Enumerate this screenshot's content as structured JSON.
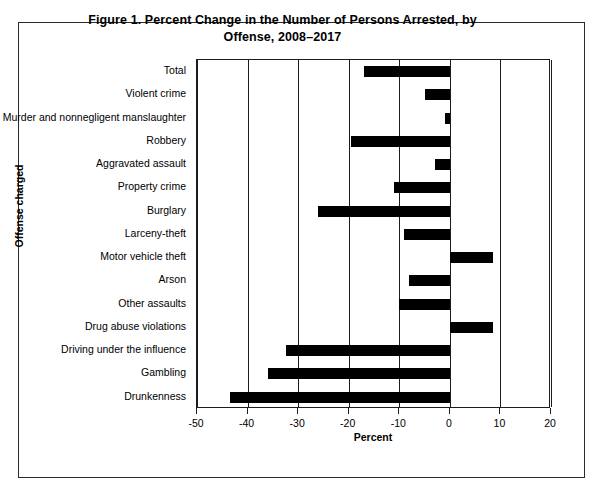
{
  "chart_data": {
    "type": "bar",
    "orientation": "horizontal",
    "title": "Figure 1. Percent Change in the Number of Persons Arrested, by Offense, 2008–2017",
    "title_line1": "Figure 1. Percent Change in the Number of Persons Arrested, by",
    "title_line2": "Offense, 2008–2017",
    "xlabel": "Percent",
    "ylabel": "Offense charged",
    "xlim": [
      -50,
      20
    ],
    "xticks": [
      -50,
      -40,
      -30,
      -20,
      -10,
      0,
      10,
      20
    ],
    "xtick_labels": [
      "-50",
      "-40",
      "-30",
      "-20",
      "-10",
      "0",
      "10",
      "20"
    ],
    "grid": true,
    "legend": null,
    "bar_color": "#000000",
    "categories": [
      "Total",
      "Violent crime",
      "Murder and nonnegligent manslaughter",
      "Robbery",
      "Aggravated assault",
      "Property crime",
      "Burglary",
      "Larceny-theft",
      "Motor vehicle theft",
      "Arson",
      "Other assaults",
      "Drug abuse violations",
      "Driving under the influence",
      "Gambling",
      "Drunkenness"
    ],
    "values": [
      -17.0,
      -5.0,
      -1.0,
      -19.5,
      -3.0,
      -11.0,
      -26.0,
      -9.0,
      8.5,
      -8.0,
      -10.0,
      8.5,
      -32.5,
      -36.0,
      -43.5
    ]
  }
}
